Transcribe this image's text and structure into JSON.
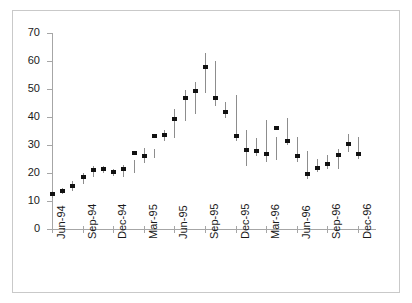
{
  "chart_data": {
    "type": "bar",
    "subtype": "high-low-close price range chart",
    "title": "",
    "subtitle": "",
    "xlabel": "",
    "ylabel": "",
    "ylim": [
      0,
      70
    ],
    "ytick_step": 10,
    "ytick_labels": [
      "0",
      "10",
      "20",
      "30",
      "40",
      "50",
      "60",
      "70"
    ],
    "ytick_values": [
      0,
      10,
      20,
      30,
      40,
      50,
      60,
      70
    ],
    "grid": false,
    "legend": "none",
    "x_tick_labels": [
      "Jun-94",
      "Sep-94",
      "Dec-94",
      "Mar-95",
      "Jun-95",
      "Sep-95",
      "Dec-95",
      "Mar-96",
      "Jun-96",
      "Sep-96",
      "Dec-96"
    ],
    "x_tick_interval_months": 3,
    "x": [
      "Jun-94",
      "Jul-94",
      "Aug-94",
      "Sep-94",
      "Oct-94",
      "Nov-94",
      "Dec-94",
      "Jan-95",
      "Feb-95",
      "Mar-95",
      "Apr-95",
      "May-95",
      "Jun-95",
      "Jul-95",
      "Aug-95",
      "Sep-95",
      "Oct-95",
      "Nov-95",
      "Dec-95",
      "Jan-96",
      "Feb-96",
      "Mar-96",
      "Apr-96",
      "May-96",
      "Jun-96",
      "Jul-96",
      "Aug-96",
      "Sep-96",
      "Oct-96",
      "Nov-96",
      "Dec-96"
    ],
    "series": [
      {
        "name": "High",
        "values": [
          13.5,
          14.5,
          17.0,
          20.0,
          22.5,
          22.5,
          21.5,
          23.0,
          24.5,
          29.0,
          28.5,
          35.5,
          43.0,
          49.5,
          52.5,
          63.0,
          60.0,
          45.5,
          48.0,
          35.5,
          32.5,
          39.0,
          33.0,
          39.5,
          33.0,
          28.0,
          25.0,
          26.5,
          28.5,
          34.0,
          33.0
        ]
      },
      {
        "name": "Low",
        "values": [
          11.0,
          12.5,
          13.5,
          16.0,
          18.5,
          20.0,
          19.0,
          18.5,
          20.0,
          23.5,
          25.5,
          31.5,
          32.5,
          38.5,
          41.0,
          48.5,
          44.0,
          39.5,
          31.5,
          22.5,
          26.0,
          24.0,
          24.5,
          30.0,
          24.0,
          18.0,
          20.5,
          21.5,
          21.5,
          27.5,
          25.0
        ]
      },
      {
        "name": "Close",
        "values": [
          12.4,
          13.4,
          15.5,
          18.5,
          21.0,
          21.4,
          20.4,
          21.4,
          27.0,
          26.2,
          33.3,
          33.6,
          39.3,
          46.8,
          49.4,
          57.9,
          46.8,
          41.9,
          33.1,
          28.3,
          27.7,
          26.8,
          36.1,
          31.3,
          26.2,
          19.8,
          21.9,
          23.3,
          26.6,
          30.3,
          26.8
        ]
      }
    ]
  },
  "style": {
    "marker_color": "#111111",
    "range_bar_color": "#8d8d8d",
    "axis_color": "#a6a6a6",
    "frame_color": "#c9c9c9",
    "background": "#ffffff",
    "text_color": "#1a1a1a"
  }
}
